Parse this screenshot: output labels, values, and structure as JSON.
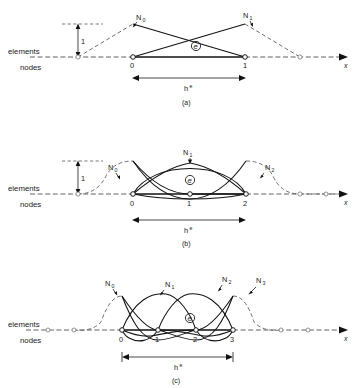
{
  "figure": {
    "header_partial": "",
    "axis_label": "x",
    "side_labels": {
      "elements": "elements",
      "nodes": "nodes"
    },
    "unit_label": "1",
    "span_label": "h",
    "span_sup": "e",
    "element_marker": "e"
  },
  "panels": [
    {
      "id": "a",
      "caption": "(a)",
      "order": "linear",
      "node_labels": [
        "0",
        "1"
      ],
      "shape_labels": [
        "N",
        "N"
      ],
      "shape_subs": [
        "0",
        "1"
      ],
      "unit_label": "1",
      "span_label": "h",
      "span_sup": "e"
    },
    {
      "id": "b",
      "caption": "(b)",
      "order": "quadratic",
      "node_labels": [
        "0",
        "1",
        "2"
      ],
      "shape_labels": [
        "N",
        "N",
        "N"
      ],
      "shape_subs": [
        "0",
        "1",
        "2"
      ],
      "unit_label": "1",
      "span_label": "h",
      "span_sup": "e"
    },
    {
      "id": "c",
      "caption": "(c)",
      "order": "cubic",
      "node_labels": [
        "0",
        "1",
        "2",
        "3"
      ],
      "shape_labels": [
        "N",
        "N",
        "N",
        "N"
      ],
      "shape_subs": [
        "0",
        "1",
        "2",
        "3"
      ],
      "span_label": "h",
      "span_sup": "e"
    }
  ],
  "colors": {
    "ink": "#111111",
    "dashed": "#555555",
    "background": "#ffffff"
  }
}
